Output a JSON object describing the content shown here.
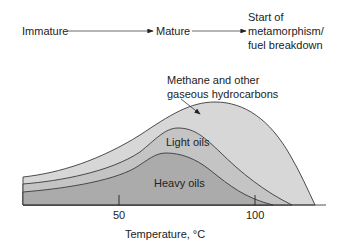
{
  "stages": {
    "immature": "Immature",
    "mature": "Mature",
    "metamorphism": "Start of\nmetamorphism/\nfuel breakdown"
  },
  "regions": {
    "gas": {
      "label": "Methane and other\ngaseous hydrocarbons",
      "color": "#d7d7d7"
    },
    "light_oils": {
      "label": "Light oils",
      "color": "#c4c4c4"
    },
    "heavy_oils": {
      "label": "Heavy oils",
      "color": "#ababab"
    }
  },
  "axis": {
    "xlabel": "Temperature,  °C",
    "ticks": [
      "50",
      "100"
    ]
  },
  "colors": {
    "line": "#3a3a3a",
    "text": "#222222"
  }
}
